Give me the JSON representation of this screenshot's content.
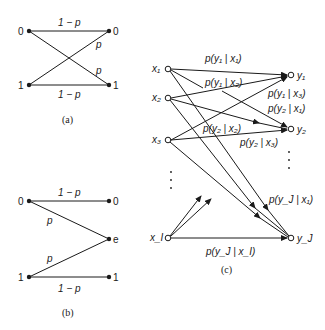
{
  "panel_a": {
    "caption": "(a)",
    "inputs": [
      "0",
      "1"
    ],
    "outputs": [
      "0",
      "1"
    ],
    "edges": {
      "top": "1 − p",
      "cross_down": "p",
      "cross_up": "p",
      "bottom": "1 − p"
    }
  },
  "panel_b": {
    "caption": "(b)",
    "inputs": [
      "0",
      "1"
    ],
    "outputs": [
      "0",
      "e",
      "1"
    ],
    "edges": {
      "top": "1 − p",
      "zero_to_e": "p",
      "one_to_e": "p",
      "bottom": "1 − p"
    }
  },
  "panel_c": {
    "caption": "(c)",
    "inputs": [
      "x₁",
      "x₂",
      "x₃",
      "x_I"
    ],
    "outputs": [
      "y₁",
      "y₂",
      "y_J"
    ],
    "labels": {
      "p_y1_x1": "p(y₁ | x₁)",
      "p_y1_x2": "p(y₁ | x₂)",
      "p_y1_x3": "p(y₁ | x₃)",
      "p_y2_x1": "p(y₂ | x₁)",
      "p_y2_x2": "p(y₂ | x₂)",
      "p_y2_x3": "p(y₂ | x₃)",
      "p_yJ_x1": "p(y_J | x₁)",
      "p_yJ_xI": "p(y_J | x_I)"
    },
    "ellipsis_vertical": "⋮"
  }
}
